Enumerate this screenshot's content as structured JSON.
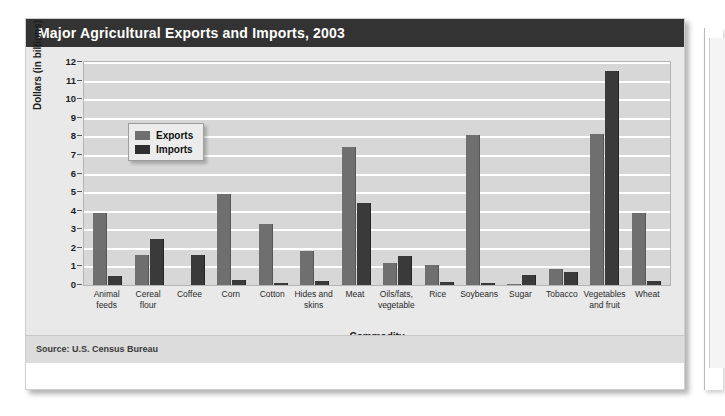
{
  "figure": {
    "title": "Major Agricultural Exports and Imports, 2003",
    "source": "Source: U.S. Census Bureau"
  },
  "legend": {
    "items": [
      {
        "label": "Exports",
        "color": "#6f6f6f",
        "swatch": "exports-swatch"
      },
      {
        "label": "Imports",
        "color": "#2f2f2f",
        "swatch": "imports-swatch"
      }
    ]
  },
  "colors": {
    "title_bar": "#333333",
    "plot_background": "#d7d7d7",
    "gridline": "#ffffff",
    "exports_bar": "#6f6f6f",
    "imports_bar": "#3a3a3a",
    "card_background": "#ffffff",
    "body_background": "#e9e9e9",
    "source_bar": "#dcdcdc"
  },
  "chart_data": {
    "type": "bar",
    "title": "Major Agricultural Exports and Imports, 2003",
    "subtitle": "",
    "xlabel": "Commodity",
    "ylabel": "Dollars (in billions)",
    "ylim": [
      0,
      12
    ],
    "yticks": [
      0,
      1,
      2,
      3,
      4,
      5,
      6,
      7,
      8,
      9,
      10,
      11,
      12
    ],
    "ytick_labels": [
      "0",
      "1",
      "2",
      "3",
      "4",
      "5",
      "6",
      "7",
      "8",
      "9",
      "10",
      "11",
      "12"
    ],
    "grid": "horizontal",
    "legend_position": "upper-left-inside",
    "categories": [
      "Animal feeds",
      "Cereal flour",
      "Coffee",
      "Corn",
      "Cotton",
      "Hides and skins",
      "Meat",
      "Oils/fats, vegetable",
      "Rice",
      "Soybeans",
      "Sugar",
      "Tobacco",
      "Vegetables and fruit",
      "Wheat"
    ],
    "category_labels_wrapped": [
      [
        "Animal",
        "feeds"
      ],
      [
        "Cereal",
        "flour"
      ],
      [
        "Coffee"
      ],
      [
        "Corn"
      ],
      [
        "Cotton"
      ],
      [
        "Hides and",
        "skins"
      ],
      [
        "Meat"
      ],
      [
        "Oils/fats,",
        "vegetable"
      ],
      [
        "Rice"
      ],
      [
        "Soybeans"
      ],
      [
        "Sugar"
      ],
      [
        "Tobacco"
      ],
      [
        "Vegetables",
        "and fruit"
      ],
      [
        "Wheat"
      ]
    ],
    "series": [
      {
        "name": "Exports",
        "color": "#6f6f6f",
        "values": [
          3.9,
          1.6,
          0.0,
          4.9,
          3.3,
          1.85,
          7.4,
          1.2,
          1.1,
          8.05,
          0.05,
          0.85,
          8.1,
          3.85
        ]
      },
      {
        "name": "Imports",
        "color": "#3a3a3a",
        "values": [
          0.5,
          2.5,
          1.6,
          0.25,
          0.1,
          0.2,
          4.4,
          1.55,
          0.15,
          0.1,
          0.55,
          0.7,
          11.5,
          0.2
        ]
      }
    ],
    "units": "billions of U.S. dollars",
    "source": "Source: U.S. Census Bureau"
  }
}
